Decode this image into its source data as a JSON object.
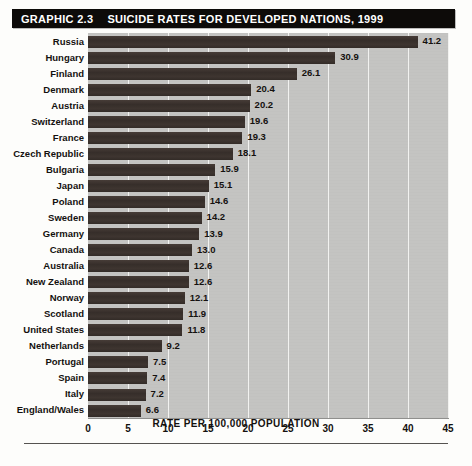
{
  "title": {
    "graphic_number": "GRAPHIC 2.3",
    "heading": "SUICIDE RATES FOR DEVELOPED NATIONS, 1999"
  },
  "chart_data": {
    "type": "bar",
    "orientation": "horizontal",
    "title": "SUICIDE RATES FOR DEVELOPED NATIONS, 1999",
    "subtitle": "GRAPHIC 2.3",
    "xlabel": "RATE PER 100,000 POPULATION",
    "ylabel": "",
    "xlim": [
      0,
      45
    ],
    "xticks": [
      "0",
      "5",
      "10",
      "15",
      "20",
      "25",
      "30",
      "35",
      "40",
      "45"
    ],
    "grid": true,
    "legend": false,
    "bar_color": "#3b322e",
    "plot_background": "#c4c4c2",
    "categories": [
      "Russia",
      "Hungary",
      "Finland",
      "Denmark",
      "Austria",
      "Switzerland",
      "France",
      "Czech Republic",
      "Bulgaria",
      "Japan",
      "Poland",
      "Sweden",
      "Germany",
      "Canada",
      "Australia",
      "New Zealand",
      "Norway",
      "Scotland",
      "United States",
      "Netherlands",
      "Portugal",
      "Spain",
      "Italy",
      "England/Wales"
    ],
    "values": [
      41.2,
      30.9,
      26.1,
      20.4,
      20.2,
      19.6,
      19.3,
      18.1,
      15.9,
      15.1,
      14.6,
      14.2,
      13.9,
      13.0,
      12.6,
      12.6,
      12.1,
      11.9,
      11.8,
      9.2,
      7.5,
      7.4,
      7.2,
      6.6
    ],
    "value_labels": [
      "41.2",
      "30.9",
      "26.1",
      "20.4",
      "20.2",
      "19.6",
      "19.3",
      "18.1",
      "15.9",
      "15.1",
      "14.6",
      "14.2",
      "13.9",
      "13.0",
      "12.6",
      "12.6",
      "12.1",
      "11.9",
      "11.8",
      "9.2",
      "7.5",
      "7.4",
      "7.2",
      "6.6"
    ]
  }
}
